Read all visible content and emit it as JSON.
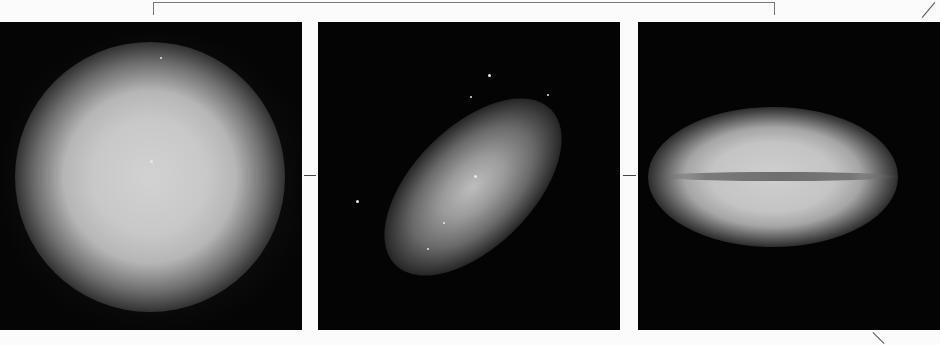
{
  "figure": {
    "panels": [
      {
        "id": "left",
        "subject": "round elliptical galaxy (face-on)"
      },
      {
        "id": "middle",
        "subject": "inclined elongated galaxy"
      },
      {
        "id": "right",
        "subject": "edge-on galaxy with dust lane"
      }
    ],
    "colors": {
      "background": "#fbfbfb",
      "panel": "#040404",
      "glow": "#c8c8c8"
    }
  }
}
